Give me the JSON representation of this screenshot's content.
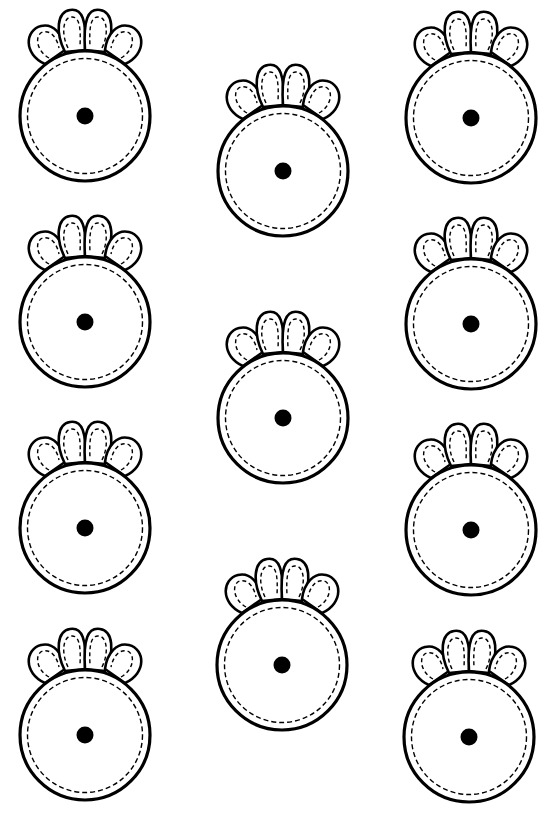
{
  "page": {
    "background": "#ffffff",
    "line_color": "#000000",
    "width": 554,
    "height": 818
  },
  "shape": {
    "name": "flower-circle-cutout",
    "outer_radius": 66,
    "inner_dashed_radius": 58,
    "dot_radius": 8,
    "petal_count": 4
  },
  "shapes": [
    {
      "column": "left",
      "cx": 85,
      "cy": 116
    },
    {
      "column": "left",
      "cx": 85,
      "cy": 322
    },
    {
      "column": "left",
      "cx": 85,
      "cy": 528
    },
    {
      "column": "left",
      "cx": 85,
      "cy": 735
    },
    {
      "column": "middle",
      "cx": 283,
      "cy": 171
    },
    {
      "column": "middle",
      "cx": 283,
      "cy": 418
    },
    {
      "column": "middle",
      "cx": 282,
      "cy": 665
    },
    {
      "column": "right",
      "cx": 471,
      "cy": 118
    },
    {
      "column": "right",
      "cx": 471,
      "cy": 324
    },
    {
      "column": "right",
      "cx": 471,
      "cy": 530
    },
    {
      "column": "right",
      "cx": 469,
      "cy": 737
    }
  ]
}
